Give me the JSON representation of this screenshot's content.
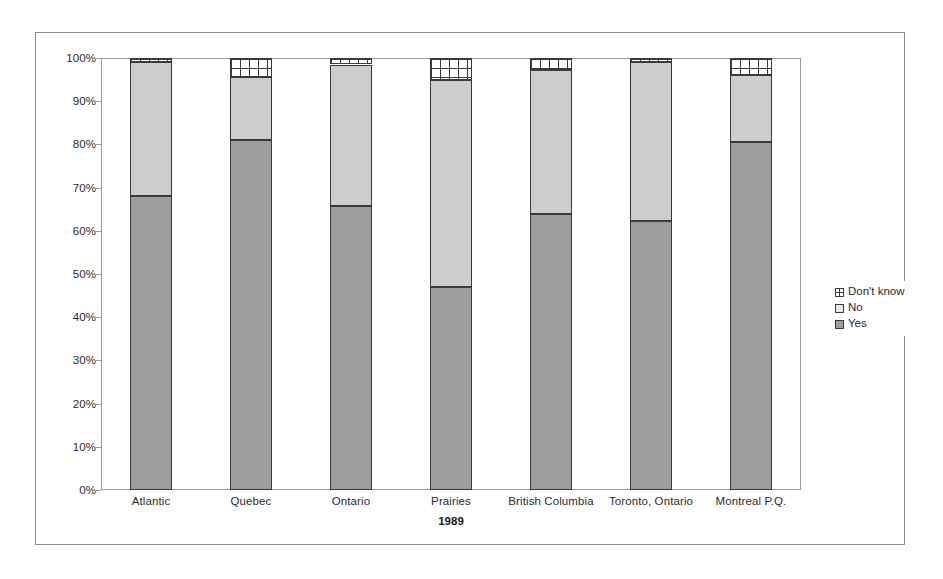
{
  "chart_data": {
    "type": "bar",
    "subtype": "stacked-100-percent",
    "title": "",
    "xlabel": "1989",
    "ylabel": "",
    "ylim": [
      0,
      100
    ],
    "yunit": "%",
    "grid": false,
    "legend_position": "right",
    "categories": [
      "Atlantic",
      "Quebec",
      "Ontario",
      "Prairies",
      "British Columbia",
      "Toronto, Ontario",
      "Montreal P.Q."
    ],
    "ytick_labels": [
      "100%",
      "90%",
      "80%",
      "70%",
      "60%",
      "50%",
      "40%",
      "30%",
      "20%",
      "10%",
      "0%"
    ],
    "ytick_values": [
      100,
      90,
      80,
      70,
      60,
      50,
      40,
      30,
      20,
      10,
      0
    ],
    "series": [
      {
        "name": "Yes",
        "color": "#9d9d9d",
        "values": [
          68.0,
          81.0,
          65.7,
          47.0,
          64.0,
          62.2,
          80.5
        ]
      },
      {
        "name": "No",
        "color": "#cdcdcd",
        "values": [
          31.0,
          14.5,
          32.8,
          48.0,
          33.3,
          36.8,
          15.5
        ]
      },
      {
        "name": "Don't know",
        "color": "#ffffff",
        "values": [
          1.0,
          4.5,
          1.5,
          5.0,
          2.7,
          1.0,
          4.0
        ]
      }
    ]
  },
  "legend": {
    "items": [
      {
        "label": "Don't know"
      },
      {
        "label": "No"
      },
      {
        "label": "Yes"
      }
    ]
  }
}
